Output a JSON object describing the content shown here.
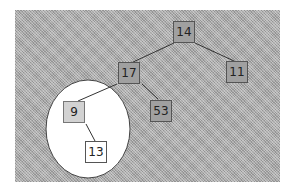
{
  "diagram": {
    "type": "binary-tree",
    "background_color": "#a8a8a8",
    "highlight_ellipse": {
      "fill": "#ffffff",
      "stroke": "#444444",
      "encloses": [
        "9",
        "13"
      ]
    },
    "nodes": [
      {
        "id": "n14",
        "label": "14",
        "style": "shaded"
      },
      {
        "id": "n17",
        "label": "17",
        "style": "shaded"
      },
      {
        "id": "n11",
        "label": "11",
        "style": "shaded"
      },
      {
        "id": "n9",
        "label": "9",
        "style": "light"
      },
      {
        "id": "n53",
        "label": "53",
        "style": "shaded"
      },
      {
        "id": "n13",
        "label": "13",
        "style": "white"
      }
    ],
    "edges": [
      {
        "from": "14",
        "to": "17"
      },
      {
        "from": "14",
        "to": "11"
      },
      {
        "from": "17",
        "to": "9"
      },
      {
        "from": "17",
        "to": "53"
      },
      {
        "from": "9",
        "to": "13"
      }
    ]
  }
}
